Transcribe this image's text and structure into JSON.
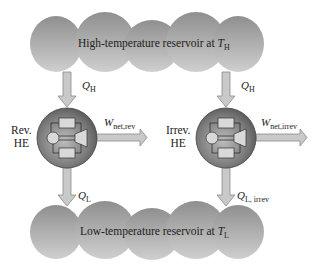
{
  "diagram": {
    "high_reservoir": {
      "label": "High-temperature reservoir at ",
      "symbol": "T",
      "subscript": "H"
    },
    "low_reservoir": {
      "label": "Low-temperature reservoir at ",
      "symbol": "T",
      "subscript": "L"
    },
    "engines": [
      {
        "label_line1": "Rev.",
        "label_line2": "HE",
        "heat_in": {
          "symbol": "Q",
          "subscript": "H"
        },
        "work_out": {
          "symbol": "W",
          "subscript": "net,rev"
        },
        "heat_out": {
          "symbol": "Q",
          "subscript": "L"
        }
      },
      {
        "label_line1": "Irrev.",
        "label_line2": "HE",
        "heat_in": {
          "symbol": "Q",
          "subscript": "H"
        },
        "work_out": {
          "symbol": "W",
          "subscript": "net,irrev"
        },
        "heat_out": {
          "symbol": "Q",
          "subscript": "L, irrev"
        }
      }
    ],
    "colors": {
      "reservoir": "#9a9a9a",
      "reservoir_light": "#c8c8c8",
      "arrow_fill": "#c9c9c9",
      "arrow_stroke": "#8a8a8a",
      "engine": "#6e6e6e",
      "engine_light": "#b5b5b5",
      "component": "#d9d9d9",
      "text": "#222222"
    }
  }
}
